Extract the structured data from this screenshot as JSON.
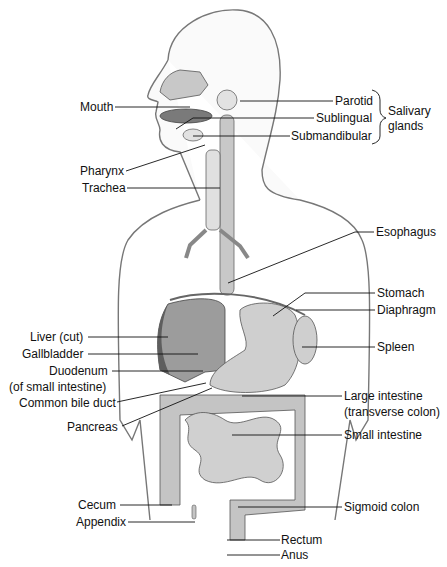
{
  "labels_left": [
    {
      "key": "mouth",
      "text": "Mouth",
      "x": 80,
      "y": 100
    },
    {
      "key": "pharynx",
      "text": "Pharynx",
      "x": 80,
      "y": 164
    },
    {
      "key": "trachea",
      "text": "Trachea",
      "x": 82,
      "y": 181
    },
    {
      "key": "liver",
      "text": "Liver (cut)",
      "x": 30,
      "y": 327
    },
    {
      "key": "gallbladder",
      "text": "Gallbladder",
      "x": 22,
      "y": 346
    },
    {
      "key": "duodenum",
      "text": "Duodenum",
      "x": 49,
      "y": 364
    },
    {
      "key": "duodenum_sub",
      "text": "(of small intestine)",
      "x": 9,
      "y": 380
    },
    {
      "key": "bile_duct",
      "text": "Common bile duct",
      "x": 19,
      "y": 396
    },
    {
      "key": "pancreas",
      "text": "Pancreas",
      "x": 67,
      "y": 420
    },
    {
      "key": "cecum",
      "text": "Cecum",
      "x": 78,
      "y": 499
    },
    {
      "key": "appendix",
      "text": "Appendix",
      "x": 76,
      "y": 515
    }
  ],
  "labels_right": [
    {
      "key": "parotid",
      "text": "Parotid",
      "x": 335,
      "y": 94
    },
    {
      "key": "sublingual",
      "text": "Sublingual",
      "x": 316,
      "y": 112
    },
    {
      "key": "submandibular",
      "text": "Submandibular",
      "x": 291,
      "y": 129
    },
    {
      "key": "esophagus",
      "text": "Esophagus",
      "x": 376,
      "y": 226
    },
    {
      "key": "stomach",
      "text": "Stomach",
      "x": 377,
      "y": 286
    },
    {
      "key": "diaphragm",
      "text": "Diaphragm",
      "x": 377,
      "y": 303
    },
    {
      "key": "spleen",
      "text": "Spleen",
      "x": 377,
      "y": 340
    },
    {
      "key": "large_intestine",
      "text": "Large intestine",
      "x": 344,
      "y": 389
    },
    {
      "key": "large_intestine_sub",
      "text": "(transverse colon)",
      "x": 344,
      "y": 405
    },
    {
      "key": "small_intestine",
      "text": "Small intestine",
      "x": 344,
      "y": 428
    },
    {
      "key": "sigmoid",
      "text": "Sigmoid colon",
      "x": 344,
      "y": 500
    },
    {
      "key": "rectum",
      "text": "Rectum",
      "x": 281,
      "y": 533
    },
    {
      "key": "anus",
      "text": "Anus",
      "x": 281,
      "y": 549
    }
  ],
  "group_label": {
    "line1": "Salivary",
    "line2": "glands"
  },
  "colors": {
    "organ_light": "#c8c8c8",
    "organ_mid": "#a9a9a9",
    "organ_dark": "#6e6e6e",
    "body_fill": "#f2f2f2",
    "line": "#111111"
  }
}
